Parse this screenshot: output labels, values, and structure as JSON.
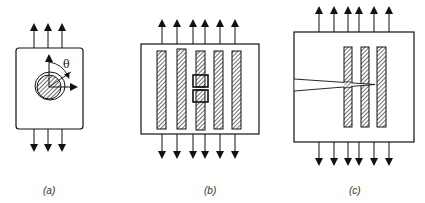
{
  "figure": {
    "panels": [
      {
        "id": "a",
        "label": "(a)",
        "description": "Single fiber with coating in matrix under uniaxial tension",
        "angle_symbol": "θ"
      },
      {
        "id": "b",
        "label": "(b)",
        "description": "Five fibers in matrix, middle fiber broken, under uniaxial tension"
      },
      {
        "id": "c",
        "label": "(c)",
        "description": "Three fibers in matrix with wedge crack from left edge bridged by fibers, under uniaxial tension"
      }
    ],
    "colors": {
      "stroke": "#111111",
      "background": "#ffffff",
      "hatch": "#222222"
    }
  }
}
